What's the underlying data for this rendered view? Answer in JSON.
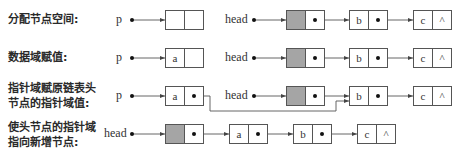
{
  "rows": [
    {
      "label": "分配节点空间:",
      "p": {
        "name": "p",
        "data": ""
      },
      "head": {
        "name": "head",
        "nodes": [
          "b",
          "c"
        ],
        "null_symbol": "^"
      }
    },
    {
      "label": "数据域赋值:",
      "p": {
        "name": "p",
        "data": "a"
      },
      "head": {
        "name": "head",
        "nodes": [
          "b",
          "c"
        ],
        "null_symbol": "^"
      }
    },
    {
      "label_line1": "指针域赋原链表头",
      "label_line2": "节点的指针域值:",
      "p": {
        "name": "p",
        "data": "a"
      },
      "head": {
        "name": "head",
        "nodes": [
          "b",
          "c"
        ],
        "null_symbol": "^"
      }
    },
    {
      "label_line1": "使头节点的指针域",
      "label_line2": "指向新增节点:",
      "head": {
        "name": "head",
        "nodes": [
          "a",
          "b",
          "c"
        ],
        "null_symbol": "^"
      }
    }
  ],
  "colors": {
    "head_node_fill": "#a5a5a5",
    "line": "#555555"
  }
}
